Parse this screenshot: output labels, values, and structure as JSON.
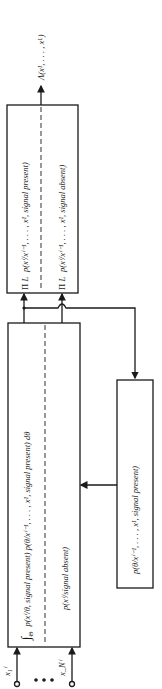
{
  "diagram": {
    "orientation": "rotated -90deg (reads bottom to top)",
    "output": {
      "label": "Λ(x¹, . . . , xᴸ)"
    },
    "inputs": [
      {
        "label": "x₁ⁱ"
      },
      {
        "label": "x_Nⁱ"
      }
    ],
    "ellipsis": "• • •",
    "blocks": {
      "likelihood_block": {
        "top_row": "∫_Θ  p(xⁱ/θ, signal present) p(θ/xⁱ⁻¹, . . . , x¹, signal present) dθ",
        "top_row_parts": {
          "integral": "∫",
          "domain": "Θ",
          "expr": "p(xⁱ/θ, signal present) p(θ/xⁱ⁻¹, . . . , x¹, signal present) dθ"
        },
        "bottom_row": "p(xⁱ/signal absent)"
      },
      "product_block": {
        "top_row": {
          "prod_upper": "L",
          "prod_symbol": "Π",
          "prod_lower": "i = 1",
          "expr": "p(xⁱ/xⁱ⁻¹, . . . , x¹, signal present)"
        },
        "bottom_row": {
          "prod_upper": "L",
          "prod_symbol": "Π",
          "prod_lower": "i = 1",
          "expr": "p(xⁱ/xⁱ⁻¹, . . . , x¹, signal absent)"
        }
      },
      "posterior_block": {
        "label": "p(θ/xⁱ⁻¹, . . . , x¹, signal present)"
      }
    }
  }
}
